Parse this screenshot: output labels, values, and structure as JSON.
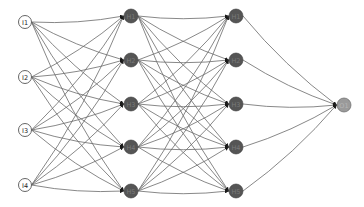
{
  "diagram": {
    "type": "feedforward-neural-network",
    "layers": [
      {
        "name": "input",
        "style": "outlined-white",
        "nodes": [
          {
            "id": "I1",
            "label": "I1"
          },
          {
            "id": "I2",
            "label": "I2"
          },
          {
            "id": "I3",
            "label": "I3"
          },
          {
            "id": "I4",
            "label": "I4"
          }
        ]
      },
      {
        "name": "hidden-1",
        "style": "filled-dark",
        "nodes": [
          {
            "id": "H1_1",
            "label": "H1"
          },
          {
            "id": "H1_2",
            "label": "H2"
          },
          {
            "id": "H1_3",
            "label": "H3"
          },
          {
            "id": "H1_4",
            "label": "H4"
          },
          {
            "id": "H1_5",
            "label": "H5"
          }
        ]
      },
      {
        "name": "hidden-2",
        "style": "filled-dark",
        "nodes": [
          {
            "id": "H2_1",
            "label": "H1"
          },
          {
            "id": "H2_2",
            "label": "H2"
          },
          {
            "id": "H2_3",
            "label": "H3"
          },
          {
            "id": "H2_4",
            "label": "H4"
          },
          {
            "id": "H2_5",
            "label": "H5"
          }
        ]
      },
      {
        "name": "output",
        "style": "filled-light",
        "nodes": [
          {
            "id": "O1",
            "label": "O1"
          }
        ]
      }
    ],
    "connectivity": "fully-connected",
    "edge_style": "curved-arrow",
    "colors": {
      "background": "#ffffff",
      "edge": "#6a6a6a",
      "input_fill": "#ffffff",
      "hidden_fill": "#555555",
      "output_fill": "#9a9a9a"
    }
  }
}
